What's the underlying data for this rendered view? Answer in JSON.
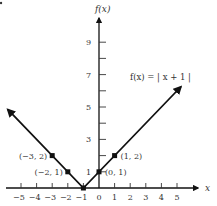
{
  "chart_data": {
    "type": "line",
    "title": "",
    "function_label": "f(x) = | x + 1 |",
    "xlabel": "x",
    "ylabel": "f(x)",
    "xlim": [
      -5.9,
      6.3
    ],
    "ylim": [
      0,
      9.5
    ],
    "grid": false,
    "x_ticks": [
      -5,
      -4,
      -3,
      -2,
      -1,
      0,
      1,
      2,
      3,
      4,
      5
    ],
    "x_tick_labels": [
      "−5",
      "−4",
      "−3",
      "−2",
      "−1",
      "0",
      "1",
      "2",
      "3",
      "4",
      "5"
    ],
    "y_ticks": [
      1,
      2,
      3,
      4,
      5,
      6,
      7,
      8,
      9
    ],
    "y_tick_labels": [
      {
        "value": 1,
        "label": "1"
      },
      {
        "value": 3,
        "label": "3"
      },
      {
        "value": 5,
        "label": "5"
      },
      {
        "value": 7,
        "label": "7"
      },
      {
        "value": 9,
        "label": "9"
      }
    ],
    "series": [
      {
        "name": "f(x) = |x + 1|",
        "x": [
          -5.85,
          -1,
          5.25
        ],
        "y": [
          4.85,
          0,
          6.25
        ],
        "arrows_at_ends": true
      }
    ],
    "labeled_points": [
      {
        "x": -3,
        "y": 2,
        "label": "(−3, 2)"
      },
      {
        "x": -2,
        "y": 1,
        "label": "(−2, 1)"
      },
      {
        "x": 0,
        "y": 1,
        "label": "(0, 1)"
      },
      {
        "x": 1,
        "y": 2,
        "label": "(1, 2)"
      },
      {
        "x": -1,
        "y": 0,
        "label": ""
      }
    ]
  }
}
